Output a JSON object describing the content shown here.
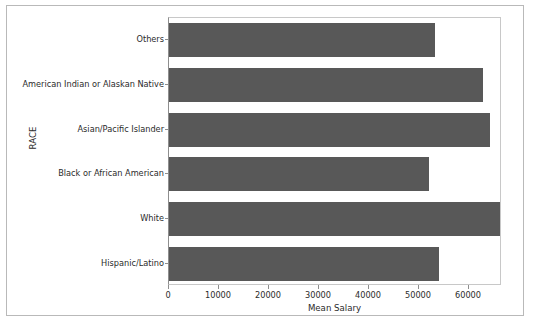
{
  "chart_data": {
    "type": "bar",
    "orientation": "horizontal",
    "title": "",
    "xlabel": "Mean Salary",
    "ylabel": "RACE",
    "categories": [
      "Others",
      "American Indian or Alaskan Native",
      "Asian/Pacific Islander",
      "Black or African American",
      "White",
      "Hispanic/Latino"
    ],
    "values": [
      53200,
      62800,
      64200,
      52000,
      66600,
      54000
    ],
    "xlim": [
      0,
      66600
    ],
    "ylim_categories": 6,
    "xticks": [
      0,
      10000,
      20000,
      30000,
      40000,
      50000,
      60000
    ],
    "xtick_labels": [
      "0",
      "10000",
      "20000",
      "30000",
      "40000",
      "50000",
      "60000"
    ],
    "grid": false,
    "legend": null,
    "bar_color": "#585858",
    "background_color": "#ffffff",
    "axis_color": "#8e8e8e"
  }
}
